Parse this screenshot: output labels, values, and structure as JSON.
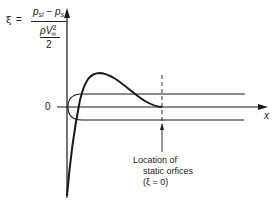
{
  "formula": {
    "lhs": "ξ",
    "equals": "=",
    "numerator_p1": "p",
    "numerator_p1_sub": "si",
    "numerator_minus": " − ",
    "numerator_p2": "p",
    "numerator_p2_sub": "s",
    "denominator_rho": "ρV",
    "denominator_sup": "2",
    "denominator_sub": "∞",
    "denominator_two": "2"
  },
  "axes": {
    "y_zero_label": "0",
    "x_label": "x"
  },
  "annotation": {
    "line1": "Location of",
    "line2": "static orfices",
    "line3": "(ξ = 0)"
  },
  "colors": {
    "stroke": "#1a1a1a",
    "background": "#ffffff"
  }
}
